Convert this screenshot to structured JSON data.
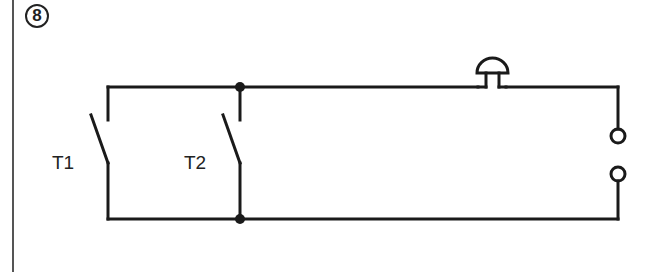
{
  "figure": {
    "number": "8"
  },
  "components": {
    "switches": [
      {
        "label": "T1",
        "type": "push-button (normally open)"
      },
      {
        "label": "T2",
        "type": "push-button (normally open)"
      }
    ],
    "bell": {
      "label": "",
      "type": "bell"
    },
    "terminals": {
      "count": 2,
      "type": "supply terminals"
    }
  },
  "colors": {
    "line": "#1a1a1a",
    "frame": "#555555",
    "background": "#ffffff"
  }
}
